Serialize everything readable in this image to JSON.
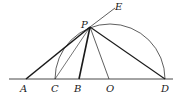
{
  "diagram": {
    "type": "geometry-construction",
    "points": {
      "A": {
        "label": "A",
        "x": 26,
        "y": 79
      },
      "C": {
        "label": "C",
        "x": 55,
        "y": 79
      },
      "B": {
        "label": "B",
        "x": 79,
        "y": 79
      },
      "O": {
        "label": "O",
        "x": 110,
        "y": 79
      },
      "D": {
        "label": "D",
        "x": 165,
        "y": 79
      },
      "P": {
        "label": "P",
        "x": 90,
        "y": 27
      },
      "E": {
        "label": "E",
        "x": 117,
        "y": 7
      }
    },
    "labels": {
      "A": "A",
      "C": "C",
      "B": "B",
      "O": "O",
      "D": "D",
      "P": "P",
      "E": "E"
    },
    "segments": [
      {
        "from": "A",
        "to": "E",
        "weight": "thick-to-P"
      },
      {
        "from": "P",
        "to": "B",
        "weight": "thick"
      },
      {
        "from": "P",
        "to": "C",
        "weight": "thin"
      },
      {
        "from": "P",
        "to": "O",
        "weight": "thin"
      },
      {
        "from": "P",
        "to": "D",
        "weight": "medium"
      }
    ],
    "arc": {
      "center": "O",
      "from": "C",
      "to": "D",
      "through": "P"
    },
    "stroke_color": "#1a1a1a"
  }
}
